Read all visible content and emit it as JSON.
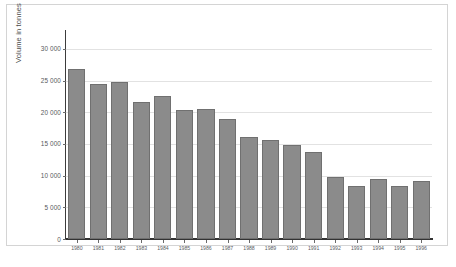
{
  "figure": {
    "background_color": "#ffffff",
    "frame_color": "#d4d4d4"
  },
  "chart_data": {
    "type": "bar",
    "title": "",
    "xlabel": "",
    "ylabel": "Volume in tonnes",
    "categories": [
      "1980",
      "1981",
      "1982",
      "1983",
      "1984",
      "1985",
      "1986",
      "1987",
      "1988",
      "1989",
      "1990",
      "1991",
      "1992",
      "1993",
      "1994",
      "1995",
      "1996"
    ],
    "values": [
      26900,
      24500,
      24700,
      21600,
      22500,
      20400,
      20500,
      18900,
      16100,
      15700,
      14800,
      13800,
      9800,
      8300,
      9500,
      8300,
      9100
    ],
    "ylim": [
      0,
      32500
    ],
    "yticks": [
      0,
      5000,
      10000,
      15000,
      20000,
      25000,
      30000
    ],
    "ytick_labels": [
      "0",
      "5 000",
      "10 000",
      "15 000",
      "20 000",
      "25 000",
      "30 000"
    ],
    "grid": true,
    "grid_axis": "y",
    "legend": false,
    "legend_position": "none",
    "bar_color": "#8b8b8b",
    "bar_edge_color": "#707070",
    "axis_color": "#333333",
    "grid_color": "#e2e2e2"
  },
  "caption": {
    "text": ""
  }
}
